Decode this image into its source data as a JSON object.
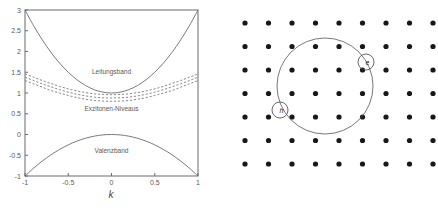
{
  "figure": {
    "panels": [
      {
        "id": "band-structure",
        "name": "band-structure-plot"
      },
      {
        "id": "lattice",
        "name": "crystal-lattice-diagram"
      }
    ]
  },
  "chart_data": [
    {
      "type": "line",
      "title": "",
      "xlabel": "k",
      "ylabel": "",
      "xlim": [
        -1,
        1
      ],
      "ylim": [
        -1,
        3
      ],
      "grid": false,
      "legend_position": "inline-annotations",
      "xticks": [
        -1,
        -0.5,
        0,
        0.5,
        1
      ],
      "xticklabels": [
        "-1",
        "-0.5",
        "0",
        "0.5",
        "1"
      ],
      "yticks": [
        -1,
        -0.5,
        0,
        0.5,
        1,
        1.5,
        2,
        2.5,
        3
      ],
      "yticklabels": [
        "-1",
        "-0.5",
        "0",
        "0.5",
        "1",
        "1.5",
        "2",
        "2.5",
        "3"
      ],
      "annotations": [
        {
          "text": "Leitungsband",
          "x": 0.0,
          "y": 1.45
        },
        {
          "text": "Exzitonen-Niveaus",
          "x": 0.0,
          "y": 0.56
        },
        {
          "text": "Valenzband",
          "x": 0.0,
          "y": -0.45
        }
      ],
      "series": [
        {
          "name": "Leitungsband",
          "style": "solid",
          "x": [
            -1,
            -0.9,
            -0.8,
            -0.7,
            -0.6,
            -0.5,
            -0.4,
            -0.3,
            -0.2,
            -0.1,
            0,
            0.1,
            0.2,
            0.3,
            0.4,
            0.5,
            0.6,
            0.7,
            0.8,
            0.9,
            1
          ],
          "values": [
            3.0,
            2.62,
            2.28,
            1.98,
            1.72,
            1.5,
            1.32,
            1.18,
            1.08,
            1.02,
            1.0,
            1.02,
            1.08,
            1.18,
            1.32,
            1.5,
            1.72,
            1.98,
            2.28,
            2.62,
            3.0
          ]
        },
        {
          "name": "Exzitonen-Niveau-1",
          "style": "dashed",
          "x": [
            -1,
            -0.9,
            -0.8,
            -0.7,
            -0.6,
            -0.5,
            -0.4,
            -0.3,
            -0.2,
            -0.1,
            0,
            0.1,
            0.2,
            0.3,
            0.4,
            0.5,
            0.6,
            0.7,
            0.8,
            0.9,
            1
          ],
          "values": [
            1.46,
            1.38,
            1.3,
            1.23,
            1.16,
            1.1,
            1.05,
            1.01,
            0.98,
            0.965,
            0.96,
            0.965,
            0.98,
            1.01,
            1.05,
            1.1,
            1.16,
            1.23,
            1.3,
            1.38,
            1.46
          ]
        },
        {
          "name": "Exzitonen-Niveau-2",
          "style": "dashed",
          "x": [
            -1,
            -0.9,
            -0.8,
            -0.7,
            -0.6,
            -0.5,
            -0.4,
            -0.3,
            -0.2,
            -0.1,
            0,
            0.1,
            0.2,
            0.3,
            0.4,
            0.5,
            0.6,
            0.7,
            0.8,
            0.9,
            1
          ],
          "values": [
            1.38,
            1.3,
            1.22,
            1.15,
            1.08,
            1.02,
            0.97,
            0.93,
            0.9,
            0.885,
            0.88,
            0.885,
            0.9,
            0.93,
            0.97,
            1.02,
            1.08,
            1.15,
            1.22,
            1.3,
            1.38
          ]
        },
        {
          "name": "Exzitonen-Niveau-3",
          "style": "dashed",
          "x": [
            -1,
            -0.9,
            -0.8,
            -0.7,
            -0.6,
            -0.5,
            -0.4,
            -0.3,
            -0.2,
            -0.1,
            0,
            0.1,
            0.2,
            0.3,
            0.4,
            0.5,
            0.6,
            0.7,
            0.8,
            0.9,
            1
          ],
          "values": [
            1.3,
            1.22,
            1.14,
            1.06,
            1.0,
            0.94,
            0.89,
            0.85,
            0.82,
            0.805,
            0.8,
            0.805,
            0.82,
            0.85,
            0.89,
            0.94,
            1.0,
            1.06,
            1.14,
            1.22,
            1.3
          ]
        },
        {
          "name": "Valenzband",
          "style": "solid",
          "x": [
            -1,
            -0.9,
            -0.8,
            -0.7,
            -0.6,
            -0.5,
            -0.4,
            -0.3,
            -0.2,
            -0.1,
            0,
            0.1,
            0.2,
            0.3,
            0.4,
            0.5,
            0.6,
            0.7,
            0.8,
            0.9,
            1
          ],
          "values": [
            -1.0,
            -0.81,
            -0.64,
            -0.49,
            -0.36,
            -0.25,
            -0.16,
            -0.09,
            -0.04,
            -0.01,
            0.0,
            -0.01,
            -0.04,
            -0.09,
            -0.16,
            -0.25,
            -0.36,
            -0.49,
            -0.64,
            -0.81,
            -1.0
          ]
        }
      ]
    }
  ],
  "lattice": {
    "name": "crystal-lattice",
    "columns": 9,
    "rows": 7,
    "dot_spacing_x": 23.5,
    "dot_spacing_y": 23.5,
    "origin_x": 25,
    "origin_y": 23,
    "dot_radius": 2.6,
    "orbit": {
      "center_x": 105,
      "center_y": 86,
      "radius": 48
    },
    "particles": [
      {
        "label": "e",
        "name": "electron-marker",
        "x": 146,
        "y": 62,
        "ring_radius": 8
      },
      {
        "label": "h",
        "name": "hole-marker",
        "x": 60,
        "y": 110,
        "ring_radius": 8
      }
    ]
  }
}
